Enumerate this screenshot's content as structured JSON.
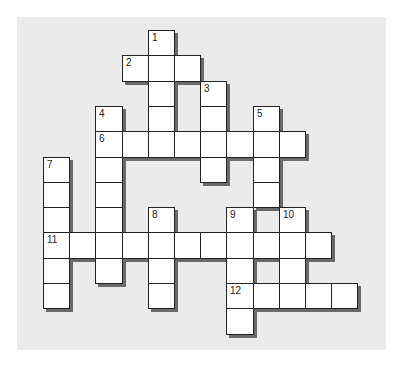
{
  "puzzle": {
    "type": "crossword",
    "grid": {
      "origin_x": 43,
      "origin_y": 30,
      "cell_w": 26.2,
      "cell_h": 25.3,
      "cols": 12,
      "rows": 12
    },
    "colors": {
      "background": "#ffffff",
      "panel": "#ebebeb",
      "cell": "#ffffff",
      "cell_border": "#222222",
      "shadow": "#6a6a6a"
    },
    "entries": [
      {
        "number": "1",
        "direction": "down",
        "row": 0,
        "col": 4,
        "length": 5
      },
      {
        "number": "2",
        "direction": "across",
        "row": 1,
        "col": 3,
        "length": 3
      },
      {
        "number": "3",
        "direction": "down",
        "row": 2,
        "col": 6,
        "length": 4
      },
      {
        "number": "4",
        "direction": "down",
        "row": 3,
        "col": 2,
        "length": 7
      },
      {
        "number": "5",
        "direction": "down",
        "row": 3,
        "col": 8,
        "length": 4
      },
      {
        "number": "6",
        "direction": "across",
        "row": 4,
        "col": 2,
        "length": 8
      },
      {
        "number": "7",
        "direction": "down",
        "row": 5,
        "col": 0,
        "length": 6
      },
      {
        "number": "8",
        "direction": "down",
        "row": 7,
        "col": 4,
        "length": 4
      },
      {
        "number": "9",
        "direction": "down",
        "row": 7,
        "col": 7,
        "length": 5
      },
      {
        "number": "10",
        "direction": "down",
        "row": 7,
        "col": 9,
        "length": 3
      },
      {
        "number": "11",
        "direction": "across",
        "row": 8,
        "col": 0,
        "length": 11
      },
      {
        "number": "12",
        "direction": "across",
        "row": 10,
        "col": 7,
        "length": 5
      }
    ]
  }
}
